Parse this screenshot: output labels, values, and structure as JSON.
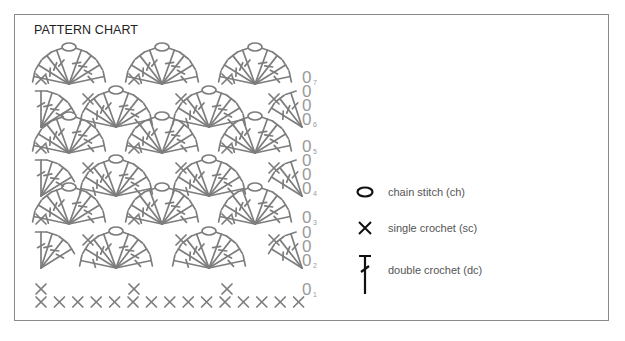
{
  "title": "PATTERN CHART",
  "colors": {
    "stitch": "#7d7d7d",
    "legend_symbol": "#111111",
    "frame": "#8a8a8a",
    "text": "#222222",
    "label": "#555555"
  },
  "legend": [
    {
      "symbol": "chain-icon",
      "label": "chain stitch (ch)"
    },
    {
      "symbol": "single-crochet-icon",
      "label": "single crochet (sc)"
    },
    {
      "symbol": "double-crochet-icon",
      "label": "double crochet (dc)"
    }
  ],
  "chart": {
    "foundation_sc_count": 15,
    "rows": [
      {
        "row": 1,
        "label_y": 289,
        "type": "sc"
      },
      {
        "row": 2,
        "label_y": 260,
        "type": "fan-offset"
      },
      {
        "row": 3,
        "label_y": 217,
        "type": "fan"
      },
      {
        "row": 4,
        "label_y": 188,
        "type": "fan-offset"
      },
      {
        "row": 5,
        "label_y": 146,
        "type": "fan"
      },
      {
        "row": 6,
        "label_y": 119,
        "type": "fan-offset"
      },
      {
        "row": 7,
        "label_y": 77,
        "type": "fan"
      }
    ],
    "row_labels": [
      "1",
      "2",
      "3",
      "4",
      "5",
      "6",
      "7"
    ]
  }
}
